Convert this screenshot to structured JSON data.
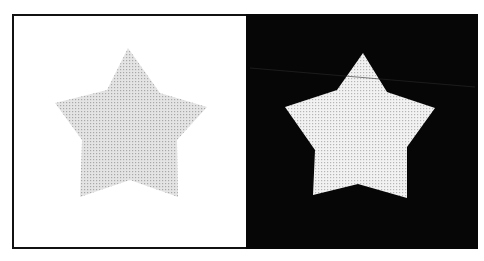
{
  "figure": {
    "panels": [
      {
        "name": "left-panel",
        "background": "#ffffff",
        "star_fill": "#d9d9d9",
        "star_points": "128,48 160,93 207,107 177,140 178,197 130,180 80,197 82,140 55,103 107,90"
      },
      {
        "name": "right-panel",
        "background": "#060606",
        "star_fill": "#ececec",
        "star_points": "363,53 387,92 435,108 407,147 407,198 358,184 313,195 315,150 285,107 337,90"
      }
    ]
  }
}
